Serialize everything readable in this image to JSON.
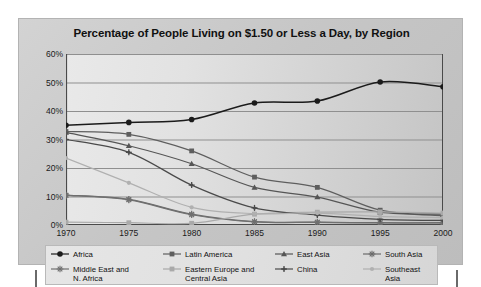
{
  "chart_data": {
    "type": "line",
    "title": "Percentage of People Living on $1.50 or Less a Day, by Region",
    "xlabel": "",
    "ylabel": "",
    "x": [
      1970,
      1975,
      1980,
      1985,
      1990,
      1995,
      2000
    ],
    "xtick_labels": [
      "1970",
      "1975",
      "1980",
      "1985",
      "1990",
      "1995",
      "2000"
    ],
    "ytick_values": [
      0,
      10,
      20,
      30,
      40,
      50,
      60
    ],
    "ytick_labels": [
      "0%",
      "10%",
      "20%",
      "30%",
      "40%",
      "50%",
      "60%"
    ],
    "ylim": [
      0,
      60
    ],
    "xlim": [
      1970,
      2000
    ],
    "grid": "horizontal",
    "legend_position": "bottom",
    "series": [
      {
        "name": "Africa",
        "marker": "filled-circle",
        "color": "#1b1b1b",
        "values": [
          35.0,
          36.0,
          37.0,
          42.8,
          43.5,
          50.2,
          48.5
        ]
      },
      {
        "name": "Latin America",
        "marker": "filled-square",
        "color": "#5e5e5e",
        "values": [
          32.8,
          31.8,
          26.0,
          16.8,
          13.2,
          5.2,
          3.2
        ]
      },
      {
        "name": "East Asia",
        "marker": "filled-triangle",
        "color": "#555555",
        "values": [
          32.5,
          27.8,
          21.5,
          13.2,
          9.8,
          4.5,
          3.8
        ]
      },
      {
        "name": "South Asia",
        "marker": "asterisk",
        "color": "#6b6b6b",
        "values": [
          10.5,
          9.0,
          3.8,
          1.2,
          1.0,
          0.8,
          0.8
        ]
      },
      {
        "name": "Middle East and\nN. Africa",
        "marker": "asterisk",
        "color": "#707070",
        "values": [
          10.4,
          8.8,
          3.6,
          1.1,
          0.9,
          0.7,
          0.7
        ]
      },
      {
        "name": "Eastern Europe and\nCentral Asia",
        "marker": "light-square",
        "color": "#a9a9a9",
        "values": [
          1.0,
          0.8,
          0.6,
          3.8,
          4.5,
          4.6,
          4.2
        ]
      },
      {
        "name": "China",
        "marker": "filled-plus",
        "color": "#4a4a4a",
        "values": [
          30.0,
          25.5,
          14.0,
          6.0,
          3.5,
          2.0,
          1.6
        ]
      },
      {
        "name": "Southeast\nAsia",
        "marker": "light-dot",
        "color": "#b0b0b0",
        "values": [
          23.5,
          14.8,
          6.2,
          4.0,
          4.2,
          3.0,
          2.6
        ]
      }
    ]
  },
  "legend": {
    "items": [
      {
        "label": "Africa",
        "icon": "filled-circle-marker"
      },
      {
        "label": "Latin America",
        "icon": "filled-square-marker"
      },
      {
        "label": "East Asia",
        "icon": "filled-triangle-marker"
      },
      {
        "label": "South Asia",
        "icon": "asterisk-marker"
      },
      {
        "label": "Middle East and\nN. Africa",
        "icon": "asterisk-marker"
      },
      {
        "label": "Eastern Europe and\nCentral Asia",
        "icon": "light-square-marker"
      },
      {
        "label": "China",
        "icon": "filled-plus-marker"
      },
      {
        "label": "Southeast\nAsia",
        "icon": "light-dot-marker"
      }
    ]
  },
  "colors": {
    "panel_background": "#cacaca",
    "plot_background": "#e2e2e2",
    "legend_background": "#e2e2e2",
    "axis": "#4a4a4a",
    "gridline": "#8f8f8f",
    "text": "#111111",
    "registration_mark": "#6a6a6a"
  }
}
